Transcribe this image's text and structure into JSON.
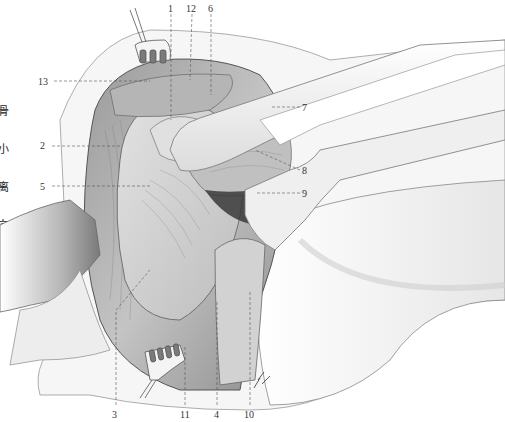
{
  "figure": {
    "side_text_chars": [
      "骨",
      "小",
      "离",
      "向",
      "有"
    ],
    "colors": {
      "background": "#ffffff",
      "ink": "#333333",
      "tissue_dark": "#6e6e6e",
      "tissue_mid": "#a8a8a8",
      "tissue_light": "#d6d6d6",
      "retractor": "#f4f4f4",
      "cavity": "#3a3a3a"
    },
    "labels": [
      {
        "id": "1",
        "text": "1",
        "x": 168,
        "y": 4
      },
      {
        "id": "12",
        "text": "12",
        "x": 186,
        "y": 4
      },
      {
        "id": "6",
        "text": "6",
        "x": 208,
        "y": 4
      },
      {
        "id": "13",
        "text": "13",
        "x": 38,
        "y": 77
      },
      {
        "id": "7",
        "text": "7",
        "x": 302,
        "y": 103
      },
      {
        "id": "2",
        "text": "2",
        "x": 40,
        "y": 141
      },
      {
        "id": "8",
        "text": "8",
        "x": 302,
        "y": 166
      },
      {
        "id": "5",
        "text": "5",
        "x": 40,
        "y": 182
      },
      {
        "id": "9",
        "text": "9",
        "x": 302,
        "y": 189
      },
      {
        "id": "3",
        "text": "3",
        "x": 112,
        "y": 410
      },
      {
        "id": "11",
        "text": "11",
        "x": 180,
        "y": 410
      },
      {
        "id": "4",
        "text": "4",
        "x": 214,
        "y": 410
      },
      {
        "id": "10",
        "text": "10",
        "x": 244,
        "y": 410
      }
    ]
  }
}
